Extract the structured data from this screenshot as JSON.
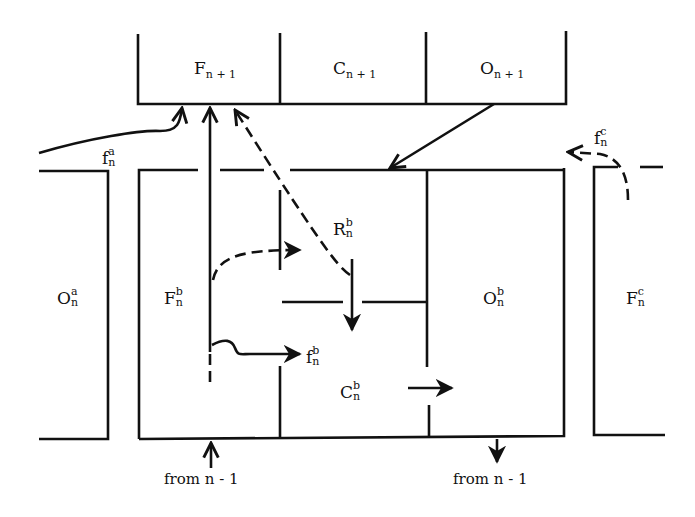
{
  "diagram": {
    "type": "compartment flow diagram",
    "top_row": [
      {
        "id": "F_n+1",
        "base": "F",
        "sub": "n + 1"
      },
      {
        "id": "C_n+1",
        "base": "C",
        "sub": "n + 1"
      },
      {
        "id": "O_n+1",
        "base": "O",
        "sub": "n + 1"
      }
    ],
    "compartments": {
      "O_a": {
        "base": "O",
        "sup": "a",
        "sub": "n"
      },
      "F_b": {
        "base": "F",
        "sup": "b",
        "sub": "n"
      },
      "R_b": {
        "base": "R",
        "sup": "b",
        "sub": "n"
      },
      "C_b": {
        "base": "C",
        "sup": "b",
        "sub": "n"
      },
      "O_b": {
        "base": "O",
        "sup": "b",
        "sub": "n"
      },
      "F_c": {
        "base": "F",
        "sup": "c",
        "sub": "n"
      }
    },
    "flows": {
      "f_a": {
        "base": "f",
        "sup": "a",
        "sub": "n"
      },
      "f_b": {
        "base": "f",
        "sup": "b",
        "sub": "n"
      },
      "f_c": {
        "base": "f",
        "sup": "c",
        "sub": "n"
      }
    },
    "bottom_labels": {
      "left": "from n - 1",
      "right": "from n - 1"
    }
  }
}
